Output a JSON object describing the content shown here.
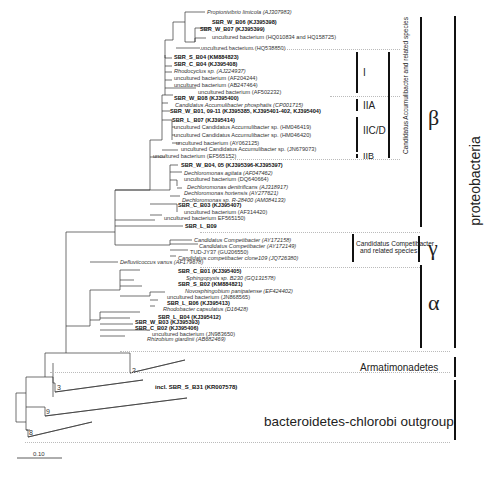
{
  "figure": {
    "type": "phylogenetic-tree",
    "scale_bar_label": "0.10"
  },
  "leaves": [
    {
      "text": "Propionivibrio limicola (AJ307983)",
      "style": "i"
    },
    {
      "text": "SBR_W_B06 (KJ395398)",
      "style": "b"
    },
    {
      "text": "SBR_W_B07 (KJ395399)",
      "style": "b"
    },
    {
      "text": "uncultured bacterium (HQ010834 and HQ158725)",
      "style": ""
    },
    {
      "text": "uncultured bacterium (HQ538850)",
      "style": ""
    },
    {
      "text": "SBR_S_B04 (KM884823)",
      "style": "b"
    },
    {
      "text": "SBR_C_B04 (KJ395408)",
      "style": "b"
    },
    {
      "text": "Rhodocyclus sp. (AJ224937)",
      "style": "i"
    },
    {
      "text": "uncultured bacterium (AF204244)",
      "style": ""
    },
    {
      "text": "uncultured bacterium (AB247464)",
      "style": ""
    },
    {
      "text": "uncultured bacterium (AF502232)",
      "style": ""
    },
    {
      "text": "SBR_W_B08 (KJ395400)",
      "style": "b"
    },
    {
      "text": "Candidatus Accumulibacter phosphatis (CP001715)",
      "style": "i"
    },
    {
      "text": "SBR_W_B01, 09-11  (KJ395385, KJ395401-402, KJ395404)",
      "style": "b"
    },
    {
      "text": "SBR_L_B07 (KJ395414)",
      "style": "b"
    },
    {
      "text": "uncultured Candidatus Accumulibacter sp. (HM046419)",
      "style": ""
    },
    {
      "text": "uncultured Candidatus Accumulibacter sp. (HM046420)",
      "style": ""
    },
    {
      "text": "uncultured bacterium (AY062125)",
      "style": ""
    },
    {
      "text": "uncultured Candidatus Accumulibacter sp. (JN679073)",
      "style": ""
    },
    {
      "text": "uncultured bacterium (EF565152)",
      "style": ""
    },
    {
      "text": "SBR_W_B04, 05 (KJ395396-KJ395397)",
      "style": "b"
    },
    {
      "text": "Dechloromonas agitata (AF047462)",
      "style": "i"
    },
    {
      "text": "uncultured bacterium (DQ640664)",
      "style": ""
    },
    {
      "text": "Dechloromonas denitrificans (AJ318917)",
      "style": "i"
    },
    {
      "text": "Dechloromonas hortensis (AY277621)",
      "style": "i"
    },
    {
      "text": "Dechloromonas sp. R-28400 (AM084133)",
      "style": "i"
    },
    {
      "text": "SBR_C_B03 (KJ395407)",
      "style": "b"
    },
    {
      "text": "uncultured bacterium (AF314420)",
      "style": ""
    },
    {
      "text": "uncultured bacterium EF565150)",
      "style": ""
    },
    {
      "text": "SBR_L_B09",
      "style": "b"
    },
    {
      "text": "Candidatus Competibacter (AY172158)",
      "style": "i"
    },
    {
      "text": "Candidatus Competibacter (AY172149)",
      "style": "i"
    },
    {
      "text": "TUD-JY37 (GU206550)",
      "style": ""
    },
    {
      "text": "Candidatus competibacter clone109 (JQ726380)",
      "style": "i"
    },
    {
      "text": "Defluviicoccus vanus (AF179678)",
      "style": "i"
    },
    {
      "text": "SBR_C_B01 (KJ395405)",
      "style": "b"
    },
    {
      "text": "Sphingopyxis sp. B230 (GQ131578)",
      "style": "i"
    },
    {
      "text": "SBR_S_B02 (KM884821)",
      "style": "b"
    },
    {
      "text": "Novosphingobium panipatense (EF424402)",
      "style": "i"
    },
    {
      "text": "uncultured bacterium (JN868565)",
      "style": ""
    },
    {
      "text": "SBR_L_B06 (KJ395413)",
      "style": "b"
    },
    {
      "text": "Rhodobacter capsulatus (D16428)",
      "style": "i"
    },
    {
      "text": "SBR_L_B04 (KJ395412)",
      "style": "b"
    },
    {
      "text": "SBR_W_B03 (KJ395393)",
      "style": "b"
    },
    {
      "text": "SBR_C_B02 (KJ395406)",
      "style": "b"
    },
    {
      "text": "uncultured bacterium (JN983650)",
      "style": ""
    },
    {
      "text": "Rhizobium giardinii (AB682469)",
      "style": "i"
    }
  ],
  "collapsed_clades": [
    {
      "count": "2"
    },
    {
      "count": "3",
      "note": "incl. SBR_S_B31 (KR007578)"
    },
    {
      "count": "9"
    },
    {
      "count": "8"
    }
  ],
  "accumulibacter_subclades": [
    "I",
    "IIA",
    "IIC/D",
    "IIB"
  ],
  "group_labels": {
    "accumulibacter": "Candidatus Accumulibacter and related species",
    "competibacter_line1": "Candidatus Competibacter",
    "competibacter_line2": "and related species",
    "beta": "β",
    "gamma": "γ",
    "alpha": "α",
    "proteobacteria": "proteobacteria",
    "armatimonadetes": "Armatimonadetes",
    "outgroup": "bacteroidetes-chlorobi outgroup"
  }
}
